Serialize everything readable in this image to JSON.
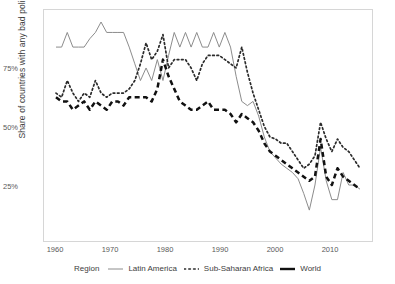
{
  "axes": {
    "ylabel": "Share of countries with any bad policy",
    "yticks": [
      "25%",
      "50%",
      "75%"
    ],
    "xticks": [
      "1960",
      "1970",
      "1980",
      "1990",
      "2000",
      "2010"
    ]
  },
  "legend": {
    "title": "Region",
    "items": [
      {
        "label": "Latin America",
        "style": "solid",
        "color": "#8c8c8c",
        "icon": "solid-line-swatch"
      },
      {
        "label": "Sub-Saharan Africa",
        "style": "dotted",
        "color": "#2b2b2b",
        "icon": "dotted-line-swatch"
      },
      {
        "label": "World",
        "style": "dashed",
        "color": "#111111",
        "icon": "dashed-line-swatch"
      }
    ]
  },
  "chart_data": {
    "type": "line",
    "title": "",
    "xlabel": "",
    "ylabel": "Share of countries with any bad policy",
    "xlim": [
      1960,
      2014
    ],
    "ylim": [
      0,
      100
    ],
    "yticks": [
      25,
      50,
      75
    ],
    "xticks": [
      1960,
      1970,
      1980,
      1990,
      2000,
      2010
    ],
    "grid": false,
    "legend_position": "bottom",
    "x": [
      1960,
      1961,
      1962,
      1963,
      1964,
      1965,
      1966,
      1967,
      1968,
      1969,
      1970,
      1971,
      1972,
      1973,
      1974,
      1975,
      1976,
      1977,
      1978,
      1979,
      1980,
      1981,
      1982,
      1983,
      1984,
      1985,
      1986,
      1987,
      1988,
      1989,
      1990,
      1991,
      1992,
      1993,
      1994,
      1995,
      1996,
      1997,
      1998,
      1999,
      2000,
      2001,
      2002,
      2003,
      2004,
      2005,
      2006,
      2007,
      2008,
      2009,
      2010,
      2011,
      2012,
      2013,
      2014
    ],
    "series": [
      {
        "name": "Latin America",
        "style": "solid",
        "color": "#8c8c8c",
        "values": [
          88,
          88,
          95,
          88,
          88,
          88,
          92,
          95,
          100,
          95,
          95,
          95,
          95,
          88,
          80,
          72,
          78,
          72,
          82,
          72,
          84,
          95,
          88,
          95,
          88,
          95,
          88,
          88,
          95,
          88,
          95,
          88,
          74,
          62,
          60,
          62,
          55,
          45,
          38,
          35,
          32,
          30,
          28,
          25,
          18,
          10,
          22,
          40,
          24,
          15,
          15,
          28,
          22,
          22,
          20
        ]
      },
      {
        "name": "Sub-Saharan Africa",
        "style": "dotted",
        "color": "#2b2b2b",
        "values": [
          66,
          64,
          72,
          66,
          62,
          66,
          64,
          72,
          66,
          64,
          66,
          66,
          66,
          68,
          72,
          80,
          90,
          82,
          86,
          94,
          78,
          82,
          82,
          82,
          78,
          72,
          80,
          84,
          84,
          84,
          82,
          80,
          78,
          88,
          76,
          66,
          58,
          50,
          45,
          44,
          42,
          42,
          38,
          34,
          30,
          32,
          36,
          52,
          44,
          38,
          44,
          40,
          38,
          34,
          30
        ]
      },
      {
        "name": "World",
        "style": "dashed",
        "color": "#111111",
        "values": [
          64,
          62,
          62,
          58,
          60,
          62,
          58,
          62,
          60,
          58,
          62,
          62,
          60,
          64,
          64,
          64,
          64,
          62,
          68,
          82,
          74,
          68,
          62,
          60,
          58,
          58,
          60,
          62,
          58,
          58,
          58,
          56,
          52,
          56,
          54,
          52,
          48,
          42,
          38,
          36,
          34,
          32,
          30,
          28,
          26,
          24,
          26,
          44,
          26,
          22,
          30,
          26,
          24,
          22,
          20
        ]
      }
    ]
  }
}
